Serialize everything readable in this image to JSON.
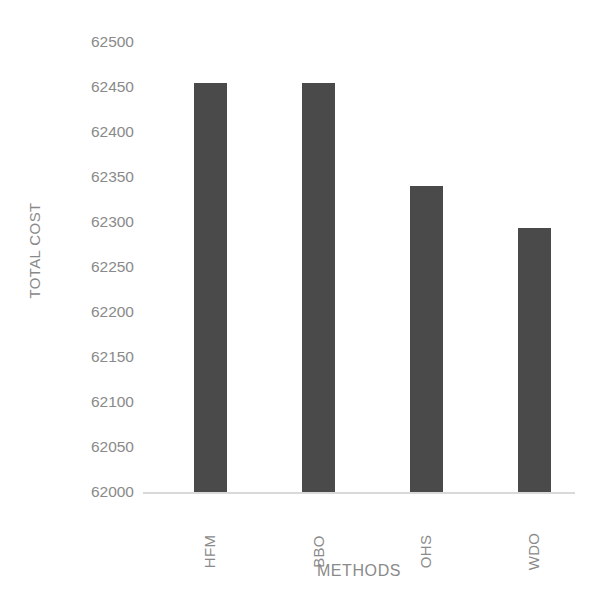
{
  "chart_data": {
    "type": "bar",
    "title": "",
    "subtitle": "",
    "xlabel": "METHODS",
    "ylabel": "TOTAL COST",
    "categories": [
      "HFM",
      "BBO",
      "OHS",
      "WDO"
    ],
    "values": [
      62455,
      62455,
      62340,
      62293
    ],
    "series": [
      {
        "name": "TOTAL COST",
        "values": [
          62455,
          62455,
          62340,
          62293
        ]
      }
    ],
    "ylim": [
      62000,
      62500
    ],
    "ytick_step": 50,
    "ytick_labels": [
      "62500",
      "62450",
      "62400",
      "62350",
      "62300",
      "62250",
      "62200",
      "62150",
      "62100",
      "62050",
      "62000"
    ],
    "ytick_values": [
      62500,
      62450,
      62400,
      62350,
      62300,
      62250,
      62200,
      62150,
      62100,
      62050,
      62000
    ],
    "grid": false,
    "legend": false,
    "legend_position": "none",
    "bar_color": "#4a4a4a",
    "axis_text_color": "#8a8a8a",
    "baseline_color": "#d9d9d9",
    "background_color": "#ffffff",
    "xtick_rotation": -90
  }
}
